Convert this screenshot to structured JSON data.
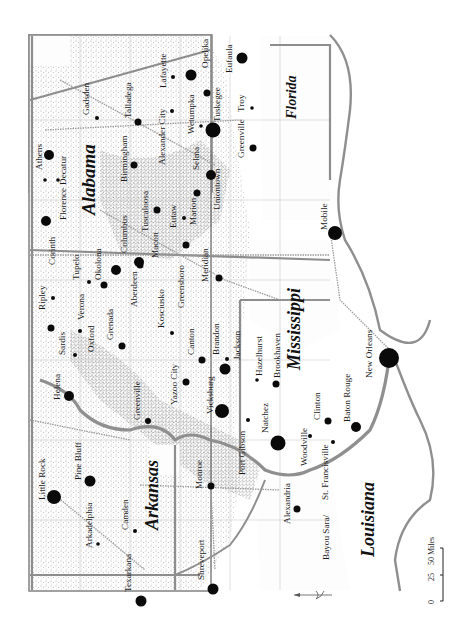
{
  "map": {
    "title": "Slave population map of the Lower Mississippi Valley region",
    "states": [
      {
        "name": "Alabama"
      },
      {
        "name": "Mississippi"
      },
      {
        "name": "Arkansas"
      },
      {
        "name": "Louisiana"
      },
      {
        "name": "Florida"
      }
    ],
    "cities": [
      {
        "name": "Athens",
        "size": "large"
      },
      {
        "name": "Decatur",
        "size": "small"
      },
      {
        "name": "Florence",
        "size": "small"
      },
      {
        "name": "Corinth",
        "size": "large"
      },
      {
        "name": "Gadsden",
        "size": "small"
      },
      {
        "name": "Talladega",
        "size": "medium"
      },
      {
        "name": "Birmingham",
        "size": "medium"
      },
      {
        "name": "Alexander City",
        "size": "small"
      },
      {
        "name": "Lafayette",
        "size": "small"
      },
      {
        "name": "Wetumpka",
        "size": "small"
      },
      {
        "name": "Opelika",
        "size": "large"
      },
      {
        "name": "Tuskegee",
        "size": "medium"
      },
      {
        "name": "Eufaula",
        "size": "large"
      },
      {
        "name": "Selma",
        "size": "xlarge"
      },
      {
        "name": "Uniontown",
        "size": "large"
      },
      {
        "name": "Greenville",
        "size": "medium"
      },
      {
        "name": "Troy",
        "size": "small"
      },
      {
        "name": "Tuscaloosa",
        "size": "medium"
      },
      {
        "name": "Eutaw",
        "size": "small"
      },
      {
        "name": "Marion",
        "size": "medium"
      },
      {
        "name": "Columbus",
        "size": "large"
      },
      {
        "name": "Macon",
        "size": "medium"
      },
      {
        "name": "Aberdeen",
        "size": "large"
      },
      {
        "name": "Okolona",
        "size": "medium"
      },
      {
        "name": "Tupelo",
        "size": "small"
      },
      {
        "name": "Ripley",
        "size": "small"
      },
      {
        "name": "Verona",
        "size": "small"
      },
      {
        "name": "Grenada",
        "size": "medium"
      },
      {
        "name": "Kosciusko",
        "size": "small"
      },
      {
        "name": "Greensboro",
        "size": "medium"
      },
      {
        "name": "Meridian",
        "size": "medium"
      },
      {
        "name": "Oxford",
        "size": "small"
      },
      {
        "name": "Sardis",
        "size": "medium"
      },
      {
        "name": "Helena",
        "size": "large"
      },
      {
        "name": "Greenville",
        "size": "medium"
      },
      {
        "name": "Canton",
        "size": "small"
      },
      {
        "name": "Brandon",
        "size": "small"
      },
      {
        "name": "Jackson",
        "size": "large"
      },
      {
        "name": "Yazoo City",
        "size": "medium"
      },
      {
        "name": "Vicksburg",
        "size": "large"
      },
      {
        "name": "Hazelhurst",
        "size": "small"
      },
      {
        "name": "Brookhaven",
        "size": "medium"
      },
      {
        "name": "Natchez",
        "size": "xlarge"
      },
      {
        "name": "Port Gibson",
        "size": "small"
      },
      {
        "name": "Woodville",
        "size": "small"
      },
      {
        "name": "Clinton",
        "size": "medium"
      },
      {
        "name": "St. Francisville",
        "size": "small"
      },
      {
        "name": "Baton Rouge",
        "size": "large"
      },
      {
        "name": "Bayou Sara/",
        "size": "none"
      },
      {
        "name": "New Orleans",
        "size": "xxlarge"
      },
      {
        "name": "Mobile",
        "size": "large"
      },
      {
        "name": "Little Rock",
        "size": "xlarge"
      },
      {
        "name": "Pine Bluff",
        "size": "large"
      },
      {
        "name": "Arkadelphia",
        "size": "small"
      },
      {
        "name": "Camden",
        "size": "small"
      },
      {
        "name": "Texarkana",
        "size": "large"
      },
      {
        "name": "Monroe",
        "size": "medium"
      },
      {
        "name": "Shreveport",
        "size": "large"
      },
      {
        "name": "Alexandria",
        "size": "medium"
      }
    ],
    "scale": {
      "ticks": [
        "0",
        "25",
        "50 Miles"
      ]
    },
    "north_arrow": "north-arrow"
  }
}
